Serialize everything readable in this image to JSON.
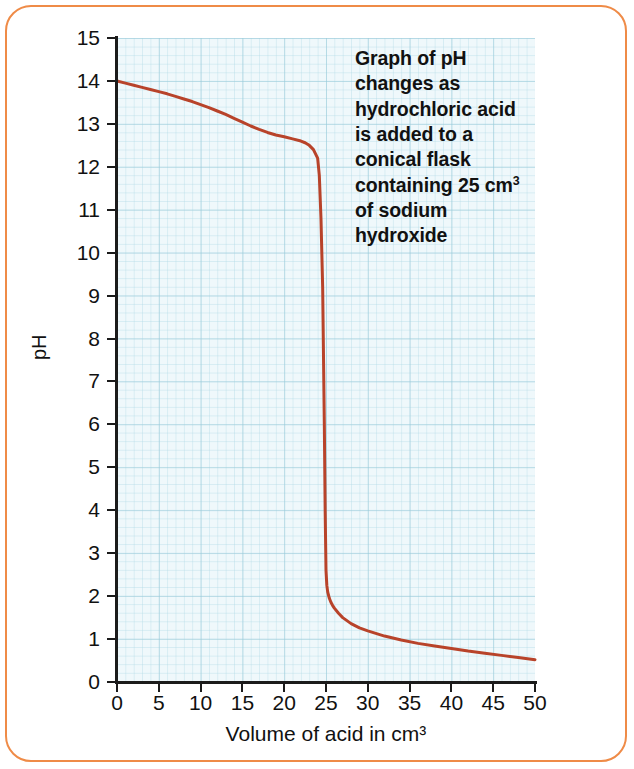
{
  "figure": {
    "frame_color": "#ef8b47",
    "background": "#ffffff",
    "annotation": "Graph of pH changes as hydrochloric acid is added to a conical flask containing 25 cm³ of sodium hydroxide"
  },
  "annotation_lines": [
    "Graph of pH",
    "changes as",
    "hydrochloric acid",
    "is added to a",
    "conical flask",
    "containing 25 cm",
    "of sodium",
    "hydroxide"
  ],
  "annotation_sup": "3",
  "chart_data": {
    "type": "line",
    "xlabel": "Volume of acid in cm³",
    "ylabel": "pH",
    "xlim": [
      0,
      50
    ],
    "ylim": [
      0,
      15
    ],
    "xticks": [
      0,
      5,
      10,
      15,
      20,
      25,
      30,
      35,
      40,
      45,
      50
    ],
    "yticks": [
      0,
      1,
      2,
      3,
      4,
      5,
      6,
      7,
      8,
      9,
      10,
      11,
      12,
      13,
      14,
      15
    ],
    "grid": true,
    "grid_style": "graph-paper",
    "grid_color": "#9ed3e3",
    "plot_background": "#eaf6fa",
    "legend": null,
    "line_color": "#b8432a",
    "line_width": 3,
    "equivalence_point": {
      "x": 25,
      "y": 7
    },
    "series": [
      {
        "name": "pH of flask contents",
        "x": [
          0,
          1,
          2,
          3,
          4,
          5,
          6,
          7,
          8,
          9,
          10,
          11,
          12,
          13,
          14,
          15,
          16,
          17,
          18,
          19,
          20,
          21,
          22,
          22.5,
          23,
          23.5,
          24,
          24.2,
          24.4,
          24.6,
          24.8,
          24.9,
          25,
          25.1,
          25.2,
          25.4,
          25.6,
          25.8,
          26,
          26.5,
          27,
          28,
          29,
          30,
          32,
          34,
          36,
          38,
          40,
          42,
          44,
          46,
          48,
          50
        ],
        "y": [
          14.0,
          13.95,
          13.9,
          13.85,
          13.8,
          13.75,
          13.7,
          13.64,
          13.58,
          13.52,
          13.45,
          13.38,
          13.3,
          13.22,
          13.13,
          13.04,
          12.95,
          12.87,
          12.8,
          12.74,
          12.7,
          12.65,
          12.6,
          12.56,
          12.5,
          12.4,
          12.2,
          11.8,
          10.8,
          9.2,
          6.0,
          4.0,
          2.6,
          2.25,
          2.1,
          1.95,
          1.85,
          1.78,
          1.72,
          1.6,
          1.5,
          1.36,
          1.26,
          1.19,
          1.07,
          0.98,
          0.9,
          0.84,
          0.78,
          0.72,
          0.67,
          0.62,
          0.57,
          0.52
        ]
      }
    ]
  }
}
